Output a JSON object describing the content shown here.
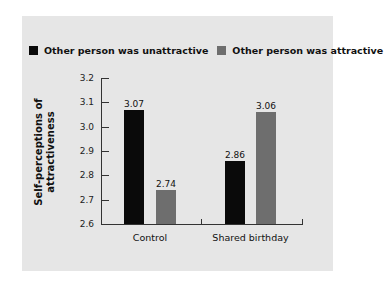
{
  "chart_data": {
    "type": "bar",
    "title": "",
    "xlabel": "",
    "ylabel": "Self-perceptions of attractiveness",
    "ylabel_lines": [
      "Self-perceptions of",
      "attractiveness"
    ],
    "categories": [
      "Control",
      "Shared birthday"
    ],
    "series": [
      {
        "name": "Other person was unattractive",
        "color": "#0a0a0a",
        "values": [
          3.07,
          2.86
        ],
        "labels": [
          "3.07",
          "2.86"
        ]
      },
      {
        "name": "Other person was attractive",
        "color": "#6e6e6e",
        "values": [
          2.74,
          3.06
        ],
        "labels": [
          "2.74",
          "3.06"
        ]
      }
    ],
    "ylim": [
      2.6,
      3.2
    ],
    "yticks": [
      "3.2",
      "3.1",
      "3.0",
      "2.9",
      "2.8",
      "2.7",
      "2.6"
    ],
    "grid": false,
    "legend_position": "top",
    "background": "#e6e6e6"
  }
}
